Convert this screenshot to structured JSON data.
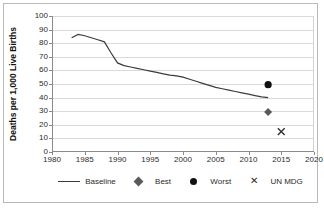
{
  "chart_data": {
    "type": "line",
    "title": "",
    "xlabel": "",
    "ylabel": "Deaths per 1,000 Live Births",
    "xlim": [
      1980,
      2020
    ],
    "ylim": [
      0,
      100
    ],
    "grid": true,
    "legend_position": "bottom",
    "xticks": [
      "1980",
      "1985",
      "1990",
      "1995",
      "2000",
      "2005",
      "2010",
      "2015",
      "2020"
    ],
    "yticks": [
      "0",
      "10",
      "20",
      "30",
      "40",
      "50",
      "60",
      "70",
      "80",
      "90",
      "100"
    ],
    "series": [
      {
        "name": "Baseline",
        "marker": "line",
        "color": "#3c3c3c",
        "x": [
          1983,
          1984,
          1985,
          1986,
          1987,
          1988,
          1989,
          1990,
          1991,
          1992,
          1993,
          1994,
          1995,
          1996,
          1997,
          1998,
          1999,
          2000,
          2001,
          2002,
          2003,
          2004,
          2005,
          2006,
          2007,
          2008,
          2009,
          2010,
          2011,
          2012,
          2013
        ],
        "values": [
          84.0,
          86.5,
          85.5,
          84.0,
          82.5,
          81.0,
          73.0,
          65.5,
          63.5,
          62.5,
          61.5,
          60.5,
          59.5,
          58.5,
          57.5,
          56.5,
          56.0,
          55.0,
          53.5,
          52.0,
          50.5,
          49.0,
          47.5,
          46.5,
          45.5,
          44.5,
          43.5,
          42.5,
          41.5,
          40.5,
          40.0
        ]
      },
      {
        "name": "Best",
        "marker": "diamond",
        "color": "#5a5a5a",
        "x": [
          2013
        ],
        "values": [
          29.5
        ]
      },
      {
        "name": "Worst",
        "marker": "circle",
        "color": "#111111",
        "x": [
          2013
        ],
        "values": [
          49.5
        ]
      },
      {
        "name": "UN MDG",
        "marker": "cross",
        "color": "#2b2b2b",
        "x": [
          2015
        ],
        "values": [
          15.0
        ]
      }
    ]
  },
  "legend": {
    "items": [
      {
        "label": "Baseline",
        "key": "line-key"
      },
      {
        "label": "Best",
        "key": "diamond-key"
      },
      {
        "label": "Worst",
        "key": "circle-key"
      },
      {
        "label": "UN MDG",
        "key": "cross-key",
        "glyph": "✕"
      }
    ]
  }
}
